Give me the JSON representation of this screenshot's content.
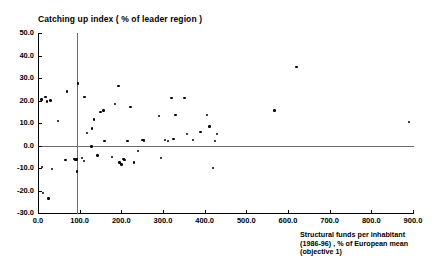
{
  "chart_data": {
    "type": "scatter",
    "title": "Catching up index ( % of leader region )",
    "ylabel": "Catching up index ( % of leader region )",
    "xlabel": "Structural funds per inhabitant\n(1986-96) , % of European mean\n(objective 1)",
    "xlabel_lines": [
      "Structural funds per inhabitant",
      "(1986-96) , % of European mean",
      "(objective 1)"
    ],
    "xlim": [
      0,
      900
    ],
    "ylim": [
      -30,
      50
    ],
    "grid": false,
    "legend": null,
    "xticks": [
      0,
      100,
      200,
      300,
      400,
      500,
      600,
      700,
      800,
      900
    ],
    "xtick_labels": [
      "0.0",
      "100.0",
      "200.0",
      "300.0",
      "400.0",
      "500.0",
      "600.0",
      "700.0",
      "800.0",
      "900.0"
    ],
    "yticks": [
      -30,
      -20,
      -10,
      0,
      10,
      20,
      30,
      40,
      50
    ],
    "ytick_labels": [
      "-30.0",
      "-20.0",
      "-10.0",
      "0.0",
      "10.0",
      "20.0",
      "30.0",
      "40.0",
      "50.0"
    ],
    "reference_lines": [
      {
        "name": "zero-horizontal",
        "orientation": "horizontal",
        "value": 0,
        "color": "#6e6e6e"
      },
      {
        "name": "vertical-marker",
        "orientation": "vertical",
        "value": 94,
        "color": "#6e6e6e"
      }
    ],
    "marker": {
      "shape": "circle",
      "color": "#000000",
      "size": 2.4
    },
    "points": [
      [
        8,
        20.5
      ],
      [
        10,
        -9.5
      ],
      [
        12,
        -21.0
      ],
      [
        18,
        21.5
      ],
      [
        22,
        19.5
      ],
      [
        25,
        -23.5
      ],
      [
        30,
        20.0
      ],
      [
        33,
        -10.5
      ],
      [
        48,
        11.0
      ],
      [
        66,
        -6.5
      ],
      [
        70,
        24.0
      ],
      [
        88,
        -6.0
      ],
      [
        90,
        -6.5
      ],
      [
        92,
        -6.3
      ],
      [
        93,
        -11.5
      ],
      [
        96,
        27.5
      ],
      [
        105,
        -5.5
      ],
      [
        110,
        -7.0
      ],
      [
        112,
        21.5
      ],
      [
        118,
        5.5
      ],
      [
        128,
        -0.5
      ],
      [
        130,
        7.5
      ],
      [
        135,
        11.5
      ],
      [
        143,
        -4.5
      ],
      [
        150,
        15.0
      ],
      [
        157,
        15.5
      ],
      [
        160,
        2.0
      ],
      [
        178,
        -5.0
      ],
      [
        185,
        18.5
      ],
      [
        193,
        26.5
      ],
      [
        196,
        -7.5
      ],
      [
        200,
        -8.5
      ],
      [
        205,
        -6.0
      ],
      [
        208,
        -6.5
      ],
      [
        215,
        2.0
      ],
      [
        222,
        17.0
      ],
      [
        230,
        -7.5
      ],
      [
        240,
        -2.5
      ],
      [
        250,
        2.5
      ],
      [
        253,
        2.5
      ],
      [
        255,
        2.0
      ],
      [
        290,
        13.0
      ],
      [
        295,
        -5.5
      ],
      [
        305,
        2.5
      ],
      [
        312,
        2.0
      ],
      [
        320,
        21.0
      ],
      [
        325,
        3.0
      ],
      [
        330,
        13.5
      ],
      [
        352,
        21.0
      ],
      [
        358,
        5.0
      ],
      [
        372,
        2.5
      ],
      [
        390,
        6.0
      ],
      [
        405,
        13.5
      ],
      [
        412,
        8.5
      ],
      [
        420,
        -10.0
      ],
      [
        425,
        2.0
      ],
      [
        430,
        5.0
      ],
      [
        568,
        15.5
      ],
      [
        620,
        35.0
      ],
      [
        890,
        10.5
      ]
    ]
  }
}
